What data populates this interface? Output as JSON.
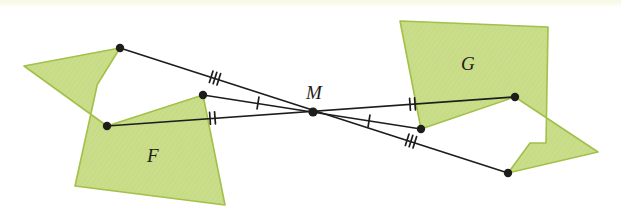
{
  "figure": {
    "background_color": "#ffffff",
    "top_strip_color": "#f7f8e4",
    "shape_fill": "#cadd8a",
    "shape_stroke": "#a2c04a",
    "line_color": "#1d1d1b",
    "dot_color": "#1d1d1b",
    "label_color": "#1d1d1b"
  },
  "labels": {
    "shape_f": "F",
    "shape_g": "G",
    "center": "M"
  },
  "label_positions": {
    "shape_f": {
      "x": 152,
      "y": 155
    },
    "shape_g": {
      "x": 466,
      "y": 63
    },
    "center": {
      "x": 314,
      "y": 92
    }
  },
  "center_point": {
    "name": "M",
    "x": 313,
    "y": 112
  },
  "shapes": [
    {
      "name": "F",
      "label": "F",
      "points": "24,66 120,48 120,48 97,85 97,86 75,186 225,205 203,95 203,95 107,126"
    },
    {
      "name": "G",
      "label": "G",
      "points": "598,152 508,173 508,173 530,143 546,143 548,27 400,21 421,129 421,129 515,97"
    }
  ],
  "vertices": [
    {
      "name": "f-top",
      "x": 120,
      "y": 48,
      "shape": "F"
    },
    {
      "name": "f-middle",
      "x": 203,
      "y": 95,
      "shape": "F"
    },
    {
      "name": "f-bottom",
      "x": 107,
      "y": 126,
      "shape": "F"
    },
    {
      "name": "g-right",
      "x": 515,
      "y": 97,
      "shape": "G"
    },
    {
      "name": "g-middle",
      "x": 421,
      "y": 129,
      "shape": "G"
    },
    {
      "name": "g-bottom",
      "x": 508,
      "y": 173,
      "shape": "G"
    },
    {
      "name": "center-m",
      "x": 313,
      "y": 112,
      "shape": "center"
    }
  ],
  "connector_lines": [
    {
      "name": "line-f-top-to-g-bottom",
      "from": "f-top",
      "to": "g-bottom",
      "x1": 120,
      "y1": 48,
      "x2": 508,
      "y2": 173,
      "tick_count": 3,
      "tick_label": "///",
      "tick_left": {
        "x": 215,
        "y": 78
      },
      "tick_right": {
        "x": 411,
        "y": 141
      }
    },
    {
      "name": "line-f-middle-to-g-middle",
      "from": "f-middle",
      "to": "g-middle",
      "x1": 203,
      "y1": 95,
      "x2": 421,
      "y2": 129,
      "tick_count": 1,
      "tick_label": "/",
      "tick_left": {
        "x": 258,
        "y": 103
      },
      "tick_right": {
        "x": 369,
        "y": 121
      }
    },
    {
      "name": "line-f-bottom-to-g-right",
      "from": "f-bottom",
      "to": "g-right",
      "x1": 107,
      "y1": 126,
      "x2": 515,
      "y2": 97,
      "tick_count": 2,
      "tick_label": "//",
      "tick_left": {
        "x": 213,
        "y": 118
      },
      "tick_right": {
        "x": 413,
        "y": 104
      }
    }
  ]
}
